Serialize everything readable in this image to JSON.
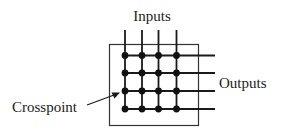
{
  "diagram": {
    "labels": {
      "inputs": "Inputs",
      "outputs": "Outputs",
      "crosspoint": "Crosspoint"
    },
    "grid": {
      "input_count": 4,
      "output_count": 4,
      "crosspoint_count": 16
    },
    "colors": {
      "line": "#1a1a1a",
      "background": "#ffffff"
    }
  }
}
